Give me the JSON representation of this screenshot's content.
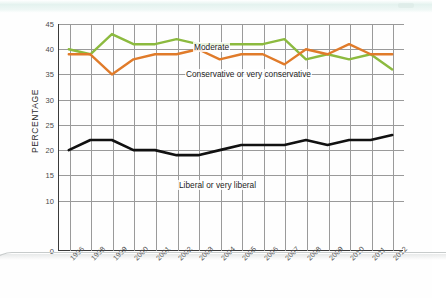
{
  "chart_data": {
    "type": "line",
    "title": "",
    "subtitle": "",
    "xlabel": "",
    "ylabel": "PERCENTAGE",
    "grid": true,
    "legend_position": "inline-annotations",
    "categories": [
      "1996",
      "1998",
      "1999",
      "2000",
      "2001",
      "2002",
      "2003",
      "2004",
      "2005",
      "2006",
      "2007",
      "2008",
      "2009",
      "2010",
      "2011",
      "2012"
    ],
    "ylim": [
      0,
      45
    ],
    "yticks": [
      0,
      10,
      15,
      20,
      25,
      30,
      35,
      40,
      45
    ],
    "ytick_labels": [
      "0",
      "10",
      "15",
      "20",
      "25",
      "30",
      "35",
      "40",
      "45"
    ],
    "series": [
      {
        "name": "Moderate",
        "color": "#8cba3f",
        "values": [
          40,
          39,
          43,
          41,
          41,
          42,
          41,
          41,
          41,
          41,
          42,
          38,
          39,
          38,
          39,
          36
        ]
      },
      {
        "name": "Conservative or very conservative",
        "color": "#e07b2a",
        "values": [
          39,
          39,
          35,
          38,
          39,
          39,
          40,
          38,
          39,
          39,
          37,
          40,
          39,
          41,
          39,
          39
        ]
      },
      {
        "name": "Liberal or very liberal",
        "color": "#111111",
        "values": [
          20,
          22,
          22,
          20,
          20,
          19,
          19,
          20,
          21,
          21,
          21,
          22,
          21,
          22,
          22,
          23
        ]
      }
    ],
    "annotations": [
      {
        "text": "Moderate",
        "series": "Moderate"
      },
      {
        "text": "Conservative or very conservative",
        "series": "Conservative or very conservative"
      },
      {
        "text": "Liberal or very liberal",
        "series": "Liberal or very liberal"
      }
    ]
  }
}
